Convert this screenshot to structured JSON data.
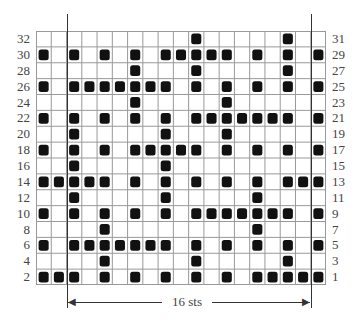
{
  "chart_data": {
    "type": "table",
    "columns": 19,
    "rows": 16,
    "repeat_label": "16 sts",
    "repeat_columns": [
      3,
      18
    ],
    "left_row_labels": [
      "32",
      "30",
      "28",
      "26",
      "24",
      "22",
      "20",
      "18",
      "16",
      "14",
      "12",
      "10",
      "8",
      "6",
      "4",
      "2"
    ],
    "right_row_labels": [
      "31",
      "29",
      "27",
      "25",
      "23",
      "21",
      "19",
      "17",
      "15",
      "13",
      "11",
      "9",
      "7",
      "5",
      "3",
      "1"
    ],
    "filled_cells_by_row": [
      {
        "row": "32/31",
        "cols": [
          11,
          17
        ]
      },
      {
        "row": "30/29",
        "cols": [
          1,
          3,
          5,
          7,
          9,
          10,
          11,
          12,
          13,
          15,
          17,
          19
        ]
      },
      {
        "row": "28/27",
        "cols": [
          7,
          11,
          17
        ]
      },
      {
        "row": "26/25",
        "cols": [
          1,
          3,
          4,
          5,
          6,
          7,
          8,
          9,
          11,
          13,
          15,
          17,
          19
        ]
      },
      {
        "row": "24/23",
        "cols": [
          7,
          13
        ]
      },
      {
        "row": "22/21",
        "cols": [
          1,
          3,
          5,
          7,
          9,
          11,
          12,
          13,
          14,
          15,
          16,
          17,
          19
        ]
      },
      {
        "row": "20/19",
        "cols": [
          3,
          9,
          13
        ]
      },
      {
        "row": "18/17",
        "cols": [
          1,
          3,
          5,
          7,
          8,
          9,
          10,
          11,
          13,
          15,
          17,
          19
        ]
      },
      {
        "row": "16/15",
        "cols": [
          3,
          9
        ]
      },
      {
        "row": "14/13",
        "cols": [
          1,
          2,
          3,
          4,
          5,
          7,
          9,
          11,
          13,
          15,
          17,
          18,
          19
        ]
      },
      {
        "row": "12/11",
        "cols": [
          3,
          9,
          15
        ]
      },
      {
        "row": "10/9",
        "cols": [
          1,
          3,
          5,
          7,
          9,
          11,
          12,
          13,
          14,
          15,
          16,
          17,
          19
        ]
      },
      {
        "row": "8/7",
        "cols": [
          5,
          15
        ]
      },
      {
        "row": "6/5",
        "cols": [
          1,
          3,
          4,
          5,
          6,
          7,
          8,
          9,
          11,
          13,
          15,
          17,
          19
        ]
      },
      {
        "row": "4/3",
        "cols": [
          5,
          11,
          17
        ]
      },
      {
        "row": "2/1",
        "cols": [
          1,
          2,
          3,
          5,
          7,
          9,
          11,
          13,
          15,
          16,
          17,
          18,
          19
        ]
      }
    ],
    "colors": {
      "filled": "#111111",
      "empty": "#ffffff",
      "gridline": "#999999"
    }
  },
  "repeat": {
    "label": "16 sts"
  }
}
